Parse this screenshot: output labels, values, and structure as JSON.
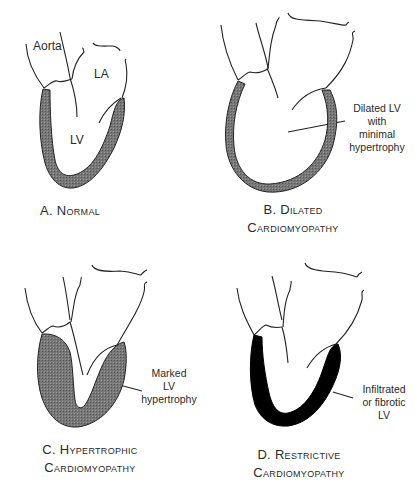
{
  "figure": {
    "panels": [
      {
        "id": "A",
        "caption_line1": "A. Normal",
        "caption_line2": "",
        "labels": [
          "Aorta",
          "LA",
          "LV"
        ],
        "annotation": [],
        "wall_fill": "#6e6e6e"
      },
      {
        "id": "B",
        "caption_line1": "B. Dilated",
        "caption_line2": "Cardiomyopathy",
        "labels": [],
        "annotation": [
          "Dilated LV",
          "with",
          "minimal",
          "hypertrophy"
        ],
        "wall_fill": "#6e6e6e"
      },
      {
        "id": "C",
        "caption_line1": "C. Hypertrophic",
        "caption_line2": "Cardiomyopathy",
        "labels": [],
        "annotation": [
          "Marked",
          "LV",
          "hypertrophy"
        ],
        "wall_fill": "#6e6e6e"
      },
      {
        "id": "D",
        "caption_line1": "D. Restrictive",
        "caption_line2": "Cardiomyopathy",
        "labels": [],
        "annotation": [
          "Infiltrated",
          "or fibrotic",
          "LV"
        ],
        "wall_fill": "#000000"
      }
    ]
  }
}
